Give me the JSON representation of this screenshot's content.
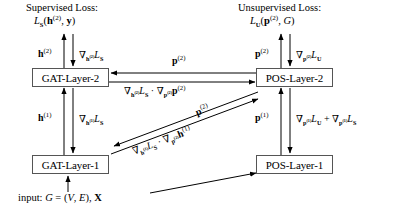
{
  "figure": {
    "width": 417,
    "height": 210,
    "background": "#ffffff",
    "line_color": "#000000",
    "box_border_color": "#555555"
  },
  "headings": {
    "supervised_title": "Supervised Loss:",
    "supervised_formula_html": "<span class=\"cal\">L</span><sub>S</sub>(<span class=\"bf\">h</span><sup>(2)</sup>, <span class=\"bf\">y</span>)",
    "unsupervised_title": "Unsupervised Loss:",
    "unsupervised_formula_html": "<span class=\"cal\">L</span><sub>U</sub>(<span class=\"bf\">p</span><sup>(2)</sup>, <span class=\"it\">G</span>)"
  },
  "nodes": [
    {
      "id": "gat2",
      "label": "GAT-Layer-2"
    },
    {
      "id": "pos2",
      "label": "POS-Layer-2"
    },
    {
      "id": "gat1",
      "label": "GAT-Layer-1"
    },
    {
      "id": "pos1",
      "label": "POS-Layer-1"
    }
  ],
  "edge_labels": {
    "h2_forward_html": "<span class=\"bf\">h</span><sup>(2)</sup>",
    "h2_grad_html": "&#8711;<sub><span class=\"bf\">h</span><sup>(2)</sup></sub><span class=\"cal\">L</span><sub>S</sub>",
    "h1_forward_html": "<span class=\"bf\">h</span><sup>(1)</sup>",
    "h1_grad_html": "&#8711;<sub><span class=\"bf\">h</span><sup>(1)</sup></sub><span class=\"cal\">L</span><sub>S</sub>",
    "p2_forward_top_html": "<span class=\"bf\">p</span><sup>(2)</sup>",
    "p2_grad_unsup_html": "&#8711;<sub><span class=\"bf\">p</span><sup>(2)</sup></sub><span class=\"cal\">L</span><sub>U</sub>",
    "p2_horizontal_html": "<span class=\"bf\">p</span><sup>(2)</sup>",
    "p2_chain_html": "&#8711;<sub><span class=\"bf\">h</span><sup>(2)</sup></sub><span class=\"cal\">L</span><sub>S</sub> &#183; &#8711;<sub><span class=\"bf\">p</span><sup>(2)</sup></sub><span class=\"bf\">p</span><sup>(2)</sup>",
    "p2_diag_forward_html": "<span class=\"bf\">p</span><sup>(2)</sup>",
    "p2_diag_chain_html": "&#8711;<sub><span class=\"bf\">h</span><sup>(1)</sup></sub><span class=\"cal\">L</span><sub>S</sub> &#183; &#8711;<sub><span class=\"bf\">p</span><sup>(2)</sup></sub><span class=\"bf\">h</span><sup>(1)</sup>",
    "p1_forward_html": "<span class=\"bf\">p</span><sup>(1)</sup>",
    "p1_grad_sum_html": "&#8711;<sub><span class=\"bf\">p</span><sup>(1)</sup></sub><span class=\"cal\">L</span><sub>U</sub> + &#8711;<sub><span class=\"bf\">p</span><sup>(1)</sup></sub><span class=\"cal\">L</span><sub>S</sub>",
    "input_html": "input: <span class=\"it\">G</span> = (<span class=\"cal\">V</span>, <span class=\"cal\">E</span>), <span class=\"bf\">X</span>"
  },
  "diagram_data": {
    "type": "diagram",
    "branches": [
      {
        "name": "supervised",
        "layers": [
          "GAT-Layer-1",
          "GAT-Layer-2"
        ],
        "loss": "L_S(h^(2), y)"
      },
      {
        "name": "unsupervised",
        "layers": [
          "POS-Layer-1",
          "POS-Layer-2"
        ],
        "loss": "L_U(p^(2), G)"
      }
    ],
    "connections": [
      {
        "from": "input",
        "to": "GAT-Layer-1",
        "kind": "forward"
      },
      {
        "from": "input",
        "to": "POS-Layer-1",
        "kind": "forward"
      },
      {
        "from": "GAT-Layer-1",
        "to": "GAT-Layer-2",
        "kind": "forward",
        "label": "h^(1)"
      },
      {
        "from": "GAT-Layer-2",
        "to": "GAT-Layer-1",
        "kind": "backward",
        "label": "grad_h1 L_S"
      },
      {
        "from": "GAT-Layer-2",
        "to": "supervised_loss",
        "kind": "forward",
        "label": "h^(2)"
      },
      {
        "from": "supervised_loss",
        "to": "GAT-Layer-2",
        "kind": "backward",
        "label": "grad_h2 L_S"
      },
      {
        "from": "POS-Layer-1",
        "to": "POS-Layer-2",
        "kind": "forward",
        "label": "p^(1)"
      },
      {
        "from": "POS-Layer-2",
        "to": "POS-Layer-1",
        "kind": "backward",
        "label": "grad_p1 L_U + grad_p1 L_S"
      },
      {
        "from": "POS-Layer-2",
        "to": "unsupervised_loss",
        "kind": "forward",
        "label": "p^(2)"
      },
      {
        "from": "unsupervised_loss",
        "to": "POS-Layer-2",
        "kind": "backward",
        "label": "grad_p2 L_U"
      },
      {
        "from": "POS-Layer-2",
        "to": "GAT-Layer-2",
        "kind": "cross-forward",
        "label": "p^(2)"
      },
      {
        "from": "GAT-Layer-2",
        "to": "POS-Layer-2",
        "kind": "cross-backward",
        "label": "grad_h2 L_S . grad_p2 p^(2)"
      },
      {
        "from": "POS-Layer-2",
        "to": "GAT-Layer-1",
        "kind": "cross-forward-diagonal",
        "label": "p^(2)"
      },
      {
        "from": "GAT-Layer-1",
        "to": "POS-Layer-2",
        "kind": "cross-backward-diagonal",
        "label": "grad_h1 L_S . grad_p2 h^(1)"
      }
    ]
  }
}
